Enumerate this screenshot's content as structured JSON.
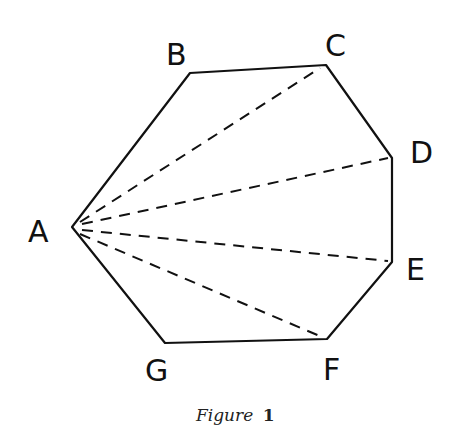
{
  "figure": {
    "caption_word": "Figure",
    "caption_number": "1",
    "vertices": [
      {
        "label": "A",
        "x": 72,
        "y": 227,
        "label_x": 28,
        "label_y": 242
      },
      {
        "label": "B",
        "x": 190,
        "y": 73,
        "label_x": 166,
        "label_y": 65
      },
      {
        "label": "C",
        "x": 326,
        "y": 65,
        "label_x": 325,
        "label_y": 56
      },
      {
        "label": "D",
        "x": 392,
        "y": 158,
        "label_x": 410,
        "label_y": 163
      },
      {
        "label": "E",
        "x": 392,
        "y": 262,
        "label_x": 406,
        "label_y": 280
      },
      {
        "label": "F",
        "x": 327,
        "y": 339,
        "label_x": 323,
        "label_y": 380
      },
      {
        "label": "G",
        "x": 165,
        "y": 343,
        "label_x": 145,
        "label_y": 381
      }
    ],
    "polygon_edges": [
      "AB",
      "BC",
      "CD",
      "DE",
      "EF",
      "FG",
      "GA"
    ],
    "diagonals_from_A": [
      "AC",
      "AD",
      "AE",
      "AF"
    ],
    "colors": {
      "line": "#111111",
      "background": "#ffffff"
    }
  }
}
